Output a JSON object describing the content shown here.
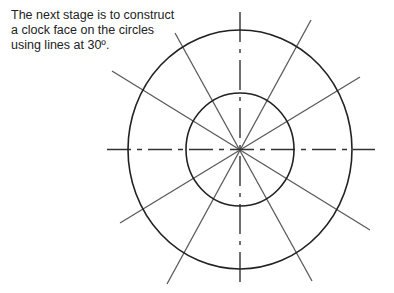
{
  "caption": {
    "lines": [
      "The next stage is to construct",
      "a clock face on the circles",
      "using lines at 30º."
    ]
  },
  "diagram": {
    "center": [
      240,
      149.5
    ],
    "outer_circle": {
      "rx": 112,
      "ry": 119.5
    },
    "inner_circle": {
      "rx": 54,
      "ry": 56.5
    },
    "center_lines": {
      "horizontal": [
        107,
        375
      ],
      "vertical": [
        12,
        287
      ],
      "style": "dash-dot"
    },
    "radial_lines_angle_step_deg": 30,
    "colors": {
      "circle": "#222222",
      "radial": "#5a5a5a",
      "centerline": "#333333"
    }
  }
}
